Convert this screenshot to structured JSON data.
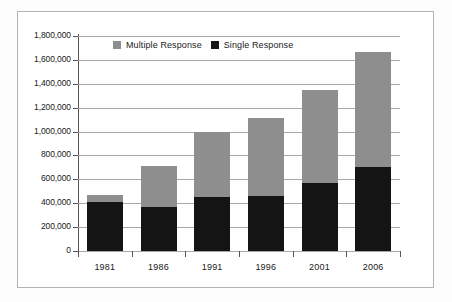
{
  "chart_data": {
    "type": "bar",
    "stacked": true,
    "title": "",
    "xlabel": "",
    "ylabel": "",
    "categories": [
      "1981",
      "1986",
      "1991",
      "1996",
      "2001",
      "2006"
    ],
    "series": [
      {
        "name": "Single Response",
        "color": "#141414",
        "values": [
          410000,
          370000,
          455000,
          460000,
          570000,
          700000
        ]
      },
      {
        "name": "Multiple Response",
        "color": "#8e8e8e",
        "values": [
          60000,
          340000,
          545000,
          650000,
          780000,
          970000
        ]
      }
    ],
    "totals": [
      470000,
      710000,
      1000000,
      1110000,
      1350000,
      1670000
    ],
    "ylim": [
      0,
      1800000
    ],
    "ytick_values": [
      0,
      200000,
      400000,
      600000,
      800000,
      1000000,
      1200000,
      1400000,
      1600000,
      1800000
    ],
    "ytick_labels": [
      "0",
      "200,000",
      "400,000",
      "600,000",
      "800,000",
      "1,000,000",
      "1,200,000",
      "1,400,000",
      "1,600,000",
      "1,800,000"
    ],
    "grid": true,
    "legend_position": "top-center",
    "legend_entries": [
      "Multiple Response",
      "Single Response"
    ]
  },
  "colors": {
    "single": "#141414",
    "multiple": "#8e8e8e",
    "gridline": "#a8a8a8",
    "axis": "#555555",
    "border": "#b3b3b3",
    "text": "#1a1a1a",
    "background": "#ffffff"
  }
}
